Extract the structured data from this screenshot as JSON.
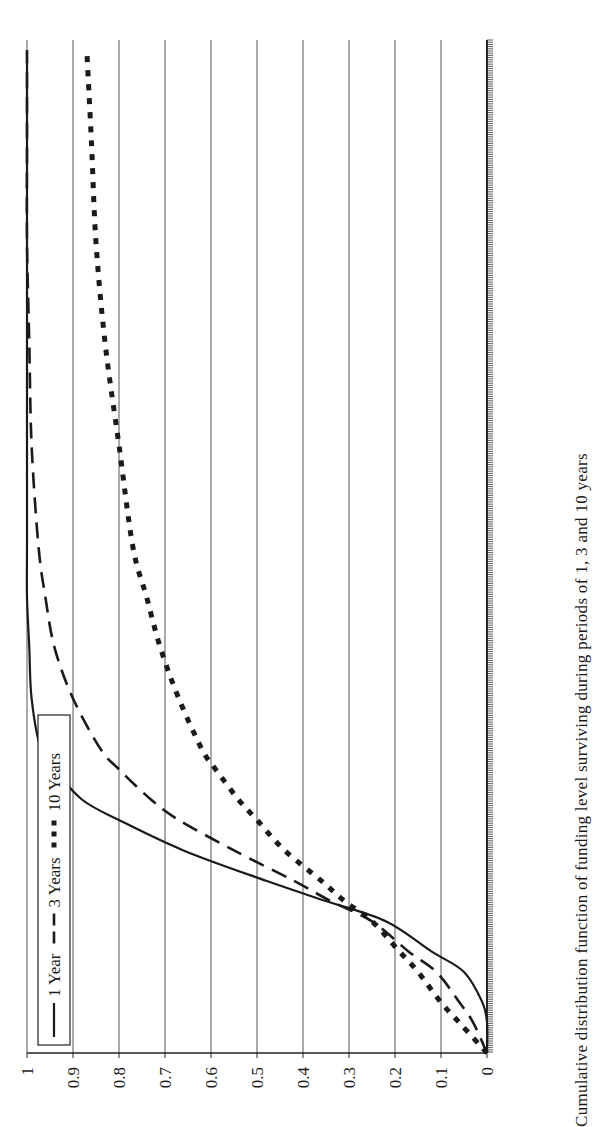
{
  "chart_data": {
    "type": "line",
    "orientation": "rotated-90-ccw",
    "title": "",
    "xlabel": "",
    "ylabel": "",
    "ylim": [
      0,
      1
    ],
    "yticks": [
      "0",
      "0.1",
      "0.2",
      "0.3",
      "0.4",
      "0.5",
      "0.6",
      "0.7",
      "0.8",
      "0.9",
      "1"
    ],
    "grid": true,
    "legend_position": "top-left (rotated)",
    "x": [
      0.0,
      0.03,
      0.05,
      0.08,
      0.1,
      0.13,
      0.15,
      0.17,
      0.2,
      0.23,
      0.25,
      0.28,
      0.3,
      0.35,
      0.4,
      0.45,
      0.5,
      0.6,
      0.7,
      0.8,
      0.9,
      0.99
    ],
    "series": [
      {
        "name": "1 Year",
        "style": "solid",
        "values": [
          0.0,
          0.0,
          0.01,
          0.05,
          0.12,
          0.22,
          0.35,
          0.48,
          0.66,
          0.8,
          0.88,
          0.94,
          0.97,
          0.99,
          0.995,
          1.0,
          1.0,
          1.0,
          1.0,
          1.0,
          1.0,
          1.0
        ]
      },
      {
        "name": "3 Years",
        "style": "dashed",
        "values": [
          0.0,
          0.03,
          0.06,
          0.11,
          0.17,
          0.25,
          0.34,
          0.42,
          0.55,
          0.67,
          0.73,
          0.8,
          0.84,
          0.9,
          0.94,
          0.96,
          0.975,
          0.99,
          0.995,
          1.0,
          1.0,
          1.0
        ]
      },
      {
        "name": "10 Years",
        "style": "dotted-thick",
        "values": [
          0.0,
          0.06,
          0.1,
          0.15,
          0.19,
          0.25,
          0.31,
          0.36,
          0.44,
          0.5,
          0.54,
          0.59,
          0.62,
          0.67,
          0.71,
          0.74,
          0.77,
          0.8,
          0.83,
          0.85,
          0.86,
          0.87
        ]
      }
    ]
  },
  "legend": {
    "items": [
      {
        "label": "1 Year",
        "style": "solid"
      },
      {
        "label": "3 Years",
        "style": "dashed"
      },
      {
        "label": "10 Years",
        "style": "dotted-thick"
      }
    ]
  },
  "axis": {
    "yticks": [
      "0",
      "0.1",
      "0.2",
      "0.3",
      "0.4",
      "0.5",
      "0.6",
      "0.7",
      "0.8",
      "0.9",
      "1"
    ]
  },
  "caption": {
    "text": "Cumulative distribution function of funding level surviving during periods of 1, 3 and 10 years"
  },
  "colors": {
    "line": "#1a1a1a",
    "grid": "#555555",
    "background": "#ffffff"
  }
}
